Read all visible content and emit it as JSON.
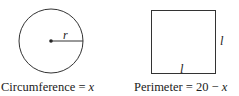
{
  "circle": {
    "radius_label": "r",
    "caption_prefix": "Circumference = ",
    "caption_var": "x"
  },
  "square": {
    "side_label_right": "l",
    "side_label_bottom": "l",
    "caption_prefix": "Perimeter = 20 − ",
    "caption_var": "x"
  },
  "colors": {
    "stroke": "#333333",
    "text": "#222222"
  }
}
